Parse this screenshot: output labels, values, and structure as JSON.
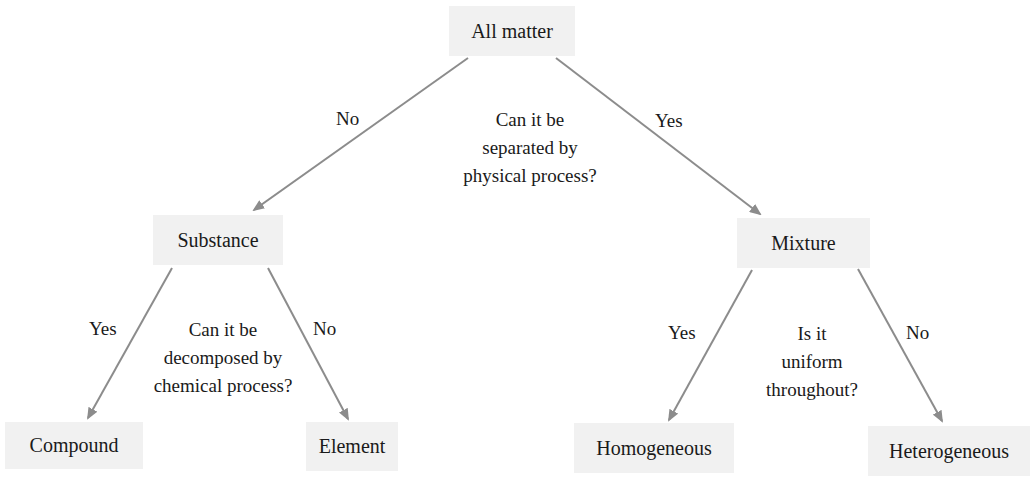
{
  "diagram": {
    "type": "decision-tree",
    "colors": {
      "box_fill": "#f1f1f1",
      "arrow": "#8c8c8c",
      "text": "#1a1a1a"
    },
    "nodes": {
      "root": "All matter",
      "substance": "Substance",
      "mixture": "Mixture",
      "compound": "Compound",
      "element": "Element",
      "homogeneous": "Homogeneous",
      "heterogeneous": "Heterogeneous"
    },
    "questions": {
      "root": [
        "Can it be",
        "separated by",
        "physical process?"
      ],
      "substance": [
        "Can it be",
        "decomposed by",
        "chemical process?"
      ],
      "mixture": [
        "Is it",
        "uniform",
        "throughout?"
      ]
    },
    "edges": [
      {
        "from": "root",
        "to": "substance",
        "label": "No"
      },
      {
        "from": "root",
        "to": "mixture",
        "label": "Yes"
      },
      {
        "from": "substance",
        "to": "compound",
        "label": "Yes"
      },
      {
        "from": "substance",
        "to": "element",
        "label": "No"
      },
      {
        "from": "mixture",
        "to": "homogeneous",
        "label": "Yes"
      },
      {
        "from": "mixture",
        "to": "heterogeneous",
        "label": "No"
      }
    ]
  }
}
